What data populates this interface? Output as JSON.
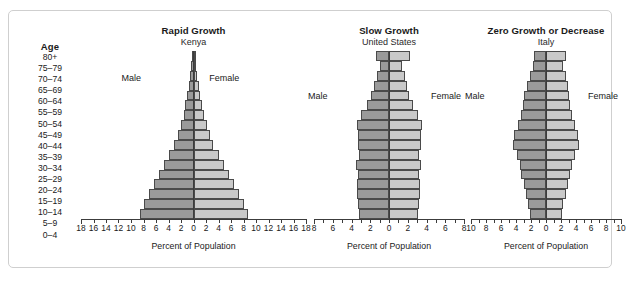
{
  "figure": {
    "age_header": "Age",
    "age_groups": [
      "80+",
      "75–79",
      "70–74",
      "65–69",
      "60–64",
      "55–59",
      "50–54",
      "45–49",
      "40–44",
      "35–39",
      "30–34",
      "25–29",
      "20–24",
      "15–19",
      "10–14",
      "5–9",
      "0–4"
    ],
    "male_label": "Male",
    "female_label": "Female",
    "axis_caption": "Percent of Population",
    "colors": {
      "male_bar": "#9a9a9a",
      "female_bar": "#c9c9c9",
      "bar_outline": "#4a4a4a",
      "axis": "#3c3c3c",
      "border": "#cfcfcf",
      "background": "#ffffff"
    }
  },
  "chart_data": [
    {
      "type": "bar",
      "chart_style": "population-pyramid",
      "title": "Rapid Growth",
      "subtitle": "Kenya",
      "xlabel": "Percent of Population",
      "ylabel": "Age",
      "categories": [
        "80+",
        "75–79",
        "70–74",
        "65–69",
        "60–64",
        "55–59",
        "50–54",
        "45–49",
        "40–44",
        "35–39",
        "30–34",
        "25–29",
        "20–24",
        "15–19",
        "10–14",
        "5–9",
        "0–4"
      ],
      "series": [
        {
          "name": "Male",
          "side": "left",
          "values": [
            0.2,
            0.35,
            0.5,
            0.75,
            1.0,
            1.3,
            1.6,
            2.0,
            2.5,
            3.1,
            3.9,
            4.8,
            5.6,
            6.4,
            7.2,
            8.0,
            8.6
          ]
        },
        {
          "name": "Female",
          "side": "right",
          "values": [
            0.25,
            0.4,
            0.6,
            0.85,
            1.1,
            1.4,
            1.7,
            2.1,
            2.6,
            3.2,
            4.0,
            4.9,
            5.7,
            6.5,
            7.3,
            8.1,
            8.7
          ]
        }
      ],
      "xlim": [
        -18,
        18
      ],
      "xticks": [
        18,
        16,
        14,
        12,
        10,
        8,
        6,
        4,
        2,
        0,
        2,
        4,
        6,
        8,
        10,
        12,
        14,
        16,
        18
      ],
      "tick_step": 2,
      "grid": false,
      "legend": [
        "Male",
        "Female"
      ],
      "legend_position": "inside-top"
    },
    {
      "type": "bar",
      "chart_style": "population-pyramid",
      "title": "Slow Growth",
      "subtitle": "United States",
      "xlabel": "Percent of Population",
      "ylabel": "Age",
      "categories": [
        "80+",
        "75–79",
        "70–74",
        "65–69",
        "60–64",
        "55–59",
        "50–54",
        "45–49",
        "40–44",
        "35–39",
        "30–34",
        "25–29",
        "20–24",
        "15–19",
        "10–14",
        "5–9",
        "0–4"
      ],
      "series": [
        {
          "name": "Male",
          "side": "left",
          "values": [
            1.4,
            1.0,
            1.3,
            1.6,
            1.9,
            2.4,
            3.0,
            3.4,
            3.3,
            3.3,
            3.2,
            3.5,
            3.3,
            3.4,
            3.4,
            3.3,
            3.2
          ]
        },
        {
          "name": "Female",
          "side": "right",
          "values": [
            2.2,
            1.4,
            1.7,
            1.9,
            2.1,
            2.6,
            3.1,
            3.5,
            3.4,
            3.4,
            3.2,
            3.4,
            3.2,
            3.3,
            3.3,
            3.2,
            3.1
          ]
        }
      ],
      "xlim": [
        -8,
        8
      ],
      "xticks": [
        8,
        6,
        4,
        2,
        0,
        2,
        4,
        6,
        8
      ],
      "tick_step": 1,
      "grid": false,
      "legend": [
        "Male",
        "Female"
      ],
      "legend_position": "inside-top"
    },
    {
      "type": "bar",
      "chart_style": "population-pyramid",
      "title": "Zero Growth or Decrease",
      "subtitle": "Italy",
      "xlabel": "Percent of Population",
      "ylabel": "Age",
      "categories": [
        "80+",
        "75–79",
        "70–74",
        "65–69",
        "60–64",
        "55–59",
        "50–54",
        "45–49",
        "40–44",
        "35–39",
        "30–34",
        "25–29",
        "20–24",
        "15–19",
        "10–14",
        "5–9",
        "0–4"
      ],
      "series": [
        {
          "name": "Male",
          "side": "left",
          "values": [
            1.6,
            1.7,
            2.2,
            2.6,
            2.9,
            3.1,
            3.3,
            3.7,
            4.3,
            4.4,
            3.9,
            3.5,
            3.3,
            3.0,
            2.7,
            2.4,
            2.2
          ]
        },
        {
          "name": "Female",
          "side": "right",
          "values": [
            2.6,
            2.3,
            2.7,
            2.9,
            3.1,
            3.2,
            3.4,
            3.8,
            4.3,
            4.4,
            3.9,
            3.5,
            3.2,
            2.9,
            2.6,
            2.3,
            2.1
          ]
        }
      ],
      "xlim": [
        -10,
        10
      ],
      "xticks": [
        10,
        8,
        6,
        4,
        2,
        0,
        2,
        4,
        6,
        8,
        10
      ],
      "tick_step": 1,
      "grid": false,
      "legend": [
        "Male",
        "Female"
      ],
      "legend_position": "inside-top"
    }
  ]
}
